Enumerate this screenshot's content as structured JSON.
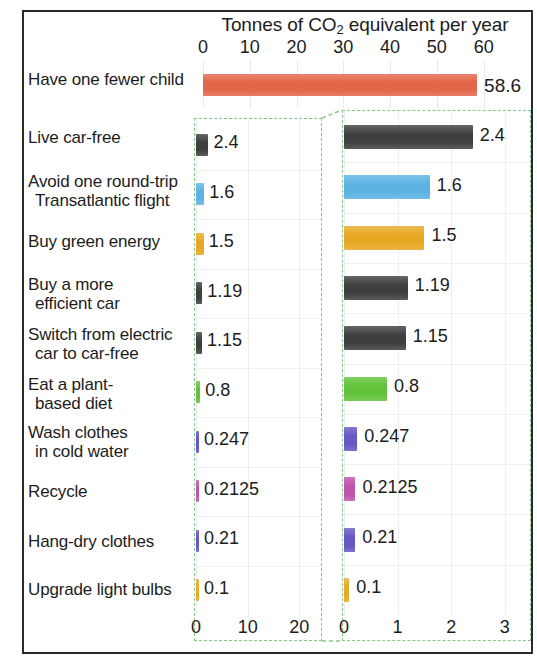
{
  "chart_data": {
    "type": "bar",
    "title": "Tonnes of CO2 equivalent per year",
    "title_parts": {
      "pre": "Tonnes of CO",
      "sub": "2",
      "post": " equivalent per year"
    },
    "xlabel": "",
    "ylabel": "",
    "orientation": "horizontal",
    "grid": true,
    "legend": "none",
    "categories": [
      "Have one fewer child",
      "Live car-free",
      "Avoid one round-trip Transatlantic flight",
      "Buy green energy",
      "Buy a more efficient car",
      "Switch from electric car to car-free",
      "Eat a plant-based diet",
      "Wash clothes in cold water",
      "Recycle",
      "Hang-dry clothes",
      "Upgrade light bulbs"
    ],
    "values": [
      58.6,
      2.4,
      1.6,
      1.5,
      1.19,
      1.15,
      0.8,
      0.247,
      0.2125,
      0.21,
      0.1
    ],
    "value_labels": [
      "58.6",
      "2.4",
      "1.6",
      "1.5",
      "1.19",
      "1.15",
      "0.8",
      "0.247",
      "0.2125",
      "0.21",
      "0.1"
    ],
    "colors": [
      "#e2674a",
      "#3f3f3f",
      "#5cb3e3",
      "#e8a824",
      "#3f3f3f",
      "#3f3f3f",
      "#63c23c",
      "#6657c4",
      "#bf54ab",
      "#6657c4",
      "#e8a824"
    ],
    "overview_axis": {
      "label": "Tonnes of CO2 equivalent per year",
      "min": 0,
      "max": 62,
      "ticks": [
        0,
        10,
        20,
        30,
        40,
        50,
        60
      ],
      "tick_labels": [
        "0",
        "10",
        "20",
        "30",
        "40",
        "50",
        "60"
      ]
    },
    "inset_left_axis": {
      "min": 0,
      "max": 24,
      "ticks": [
        0,
        10,
        20
      ],
      "tick_labels": [
        "0",
        "10",
        "20"
      ]
    },
    "inset_right_axis": {
      "min": 0,
      "max": 3.45,
      "ticks": [
        0,
        1,
        2,
        3
      ],
      "tick_labels": [
        "0",
        "1",
        "2",
        "3"
      ]
    },
    "callout_color": "#86c78a",
    "annotation": "The lower ten actions are magnified from the left inset into the right inset."
  },
  "rows": [
    {
      "label_line1": "Have one fewer child",
      "label_line2": "",
      "value_label": "58.6",
      "value": 58.6,
      "color": "#e2674a"
    },
    {
      "label_line1": "Live car-free",
      "label_line2": "",
      "value_label": "2.4",
      "value": 2.4,
      "color": "#3f3f3f"
    },
    {
      "label_line1": "Avoid one round-trip",
      "label_line2": "Transatlantic flight",
      "value_label": "1.6",
      "value": 1.6,
      "color": "#5cb3e3"
    },
    {
      "label_line1": "Buy green energy",
      "label_line2": "",
      "value_label": "1.5",
      "value": 1.5,
      "color": "#e8a824"
    },
    {
      "label_line1": "Buy a more",
      "label_line2": "efficient car",
      "value_label": "1.19",
      "value": 1.19,
      "color": "#3f3f3f"
    },
    {
      "label_line1": "Switch from electric",
      "label_line2": "car to car-free",
      "value_label": "1.15",
      "value": 1.15,
      "color": "#3f3f3f"
    },
    {
      "label_line1": "Eat a plant-",
      "label_line2": "based diet",
      "value_label": "0.8",
      "value": 0.8,
      "color": "#63c23c"
    },
    {
      "label_line1": "Wash clothes",
      "label_line2": "in cold water",
      "value_label": "0.247",
      "value": 0.247,
      "color": "#6657c4"
    },
    {
      "label_line1": "Recycle",
      "label_line2": "",
      "value_label": "0.2125",
      "value": 0.2125,
      "color": "#bf54ab"
    },
    {
      "label_line1": "Hang-dry clothes",
      "label_line2": "",
      "value_label": "0.21",
      "value": 0.21,
      "color": "#6657c4"
    },
    {
      "label_line1": "Upgrade light bulbs",
      "label_line2": "",
      "value_label": "0.1",
      "value": 0.1,
      "color": "#e8a824"
    }
  ],
  "top_ticks": [
    "0",
    "10",
    "20",
    "30",
    "40",
    "50",
    "60"
  ],
  "bottom_ticks_left": [
    "0",
    "10",
    "20"
  ],
  "bottom_ticks_right": [
    "0",
    "1",
    "2",
    "3"
  ]
}
